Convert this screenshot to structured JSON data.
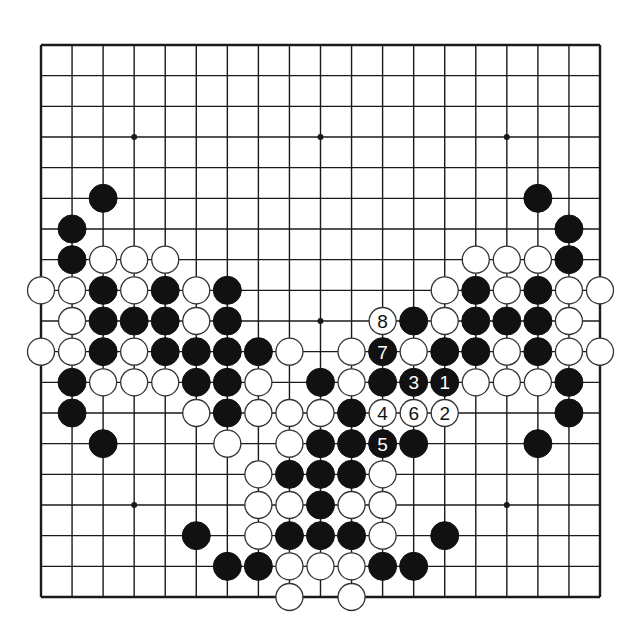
{
  "diagram": {
    "type": "go-board",
    "board_size": 19,
    "grid": {
      "left": 41,
      "top": 45,
      "right": 600,
      "bottom": 597,
      "line_color": "#1a1a1a",
      "border_width": 2.4,
      "line_width": 1.4
    },
    "stone_radius": 14,
    "colors": {
      "black": "#111111",
      "white": "#ffffff",
      "stone_outline": "#333333",
      "background": "#ffffff"
    },
    "star_points": [
      [
        3,
        3
      ],
      [
        9,
        3
      ],
      [
        15,
        3
      ],
      [
        3,
        9
      ],
      [
        9,
        9
      ],
      [
        15,
        9
      ],
      [
        3,
        15
      ],
      [
        9,
        15
      ],
      [
        15,
        15
      ]
    ],
    "black_stones": [
      [
        2,
        5
      ],
      [
        16,
        5
      ],
      [
        1,
        6
      ],
      [
        17,
        6
      ],
      [
        1,
        7
      ],
      [
        17,
        7
      ],
      [
        2,
        8
      ],
      [
        4,
        8
      ],
      [
        6,
        8
      ],
      [
        14,
        8
      ],
      [
        16,
        8
      ],
      [
        2,
        9
      ],
      [
        3,
        9
      ],
      [
        4,
        9
      ],
      [
        6,
        9
      ],
      [
        12,
        9
      ],
      [
        14,
        9
      ],
      [
        15,
        9
      ],
      [
        16,
        9
      ],
      [
        2,
        10
      ],
      [
        4,
        10
      ],
      [
        5,
        10
      ],
      [
        6,
        10
      ],
      [
        7,
        10
      ],
      [
        13,
        10
      ],
      [
        14,
        10
      ],
      [
        16,
        10
      ],
      [
        1,
        11
      ],
      [
        5,
        11
      ],
      [
        6,
        11
      ],
      [
        9,
        11
      ],
      [
        11,
        11
      ],
      [
        17,
        11
      ],
      [
        1,
        12
      ],
      [
        6,
        12
      ],
      [
        10,
        12
      ],
      [
        17,
        12
      ],
      [
        2,
        13
      ],
      [
        9,
        13
      ],
      [
        10,
        13
      ],
      [
        12,
        13
      ],
      [
        16,
        13
      ],
      [
        8,
        14
      ],
      [
        9,
        14
      ],
      [
        10,
        14
      ],
      [
        9,
        15
      ],
      [
        5,
        16
      ],
      [
        8,
        16
      ],
      [
        9,
        16
      ],
      [
        10,
        16
      ],
      [
        13,
        16
      ],
      [
        6,
        17
      ],
      [
        7,
        17
      ],
      [
        11,
        17
      ],
      [
        12,
        17
      ]
    ],
    "white_stones": [
      [
        2,
        7
      ],
      [
        3,
        7
      ],
      [
        4,
        7
      ],
      [
        14,
        7
      ],
      [
        15,
        7
      ],
      [
        16,
        7
      ],
      [
        0,
        8
      ],
      [
        1,
        8
      ],
      [
        3,
        8
      ],
      [
        5,
        8
      ],
      [
        13,
        8
      ],
      [
        15,
        8
      ],
      [
        17,
        8
      ],
      [
        18,
        8
      ],
      [
        1,
        9
      ],
      [
        5,
        9
      ],
      [
        13,
        9
      ],
      [
        17,
        9
      ],
      [
        0,
        10
      ],
      [
        1,
        10
      ],
      [
        3,
        10
      ],
      [
        8,
        10
      ],
      [
        10,
        10
      ],
      [
        12,
        10
      ],
      [
        15,
        10
      ],
      [
        17,
        10
      ],
      [
        18,
        10
      ],
      [
        2,
        11
      ],
      [
        3,
        11
      ],
      [
        4,
        11
      ],
      [
        7,
        11
      ],
      [
        10,
        11
      ],
      [
        14,
        11
      ],
      [
        15,
        11
      ],
      [
        16,
        11
      ],
      [
        5,
        12
      ],
      [
        7,
        12
      ],
      [
        8,
        12
      ],
      [
        9,
        12
      ],
      [
        6,
        13
      ],
      [
        8,
        13
      ],
      [
        7,
        14
      ],
      [
        11,
        14
      ],
      [
        7,
        15
      ],
      [
        8,
        15
      ],
      [
        10,
        15
      ],
      [
        11,
        15
      ],
      [
        7,
        16
      ],
      [
        11,
        16
      ],
      [
        8,
        17
      ],
      [
        9,
        17
      ],
      [
        10,
        17
      ],
      [
        8,
        18
      ],
      [
        10,
        18
      ]
    ],
    "numbered_moves": [
      {
        "number": "1",
        "color": "black",
        "x": 13,
        "y": 11
      },
      {
        "number": "2",
        "color": "white",
        "x": 13,
        "y": 12
      },
      {
        "number": "3",
        "color": "black",
        "x": 12,
        "y": 11
      },
      {
        "number": "4",
        "color": "white",
        "x": 11,
        "y": 12
      },
      {
        "number": "5",
        "color": "black",
        "x": 11,
        "y": 13
      },
      {
        "number": "6",
        "color": "white",
        "x": 12,
        "y": 12
      },
      {
        "number": "7",
        "color": "black",
        "x": 11,
        "y": 10
      },
      {
        "number": "8",
        "color": "white",
        "x": 11,
        "y": 9
      }
    ]
  }
}
